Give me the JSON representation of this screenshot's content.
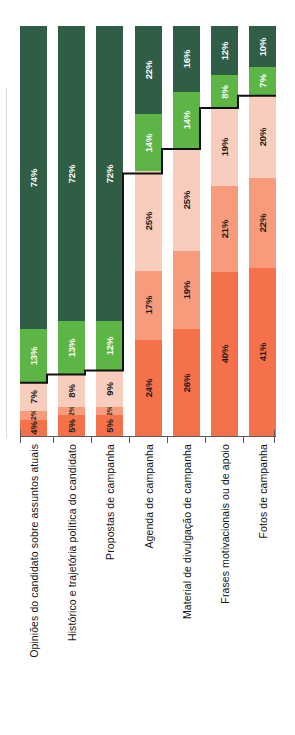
{
  "chart_data": {
    "type": "bar",
    "orientation": "vertical-stacked-100-rotated",
    "title": "",
    "subtitle": "",
    "xlabel": "",
    "ylabel": "",
    "ylim": [
      0,
      100
    ],
    "grid": false,
    "legend_position": "none",
    "stacked": true,
    "normalized_percent": true,
    "categories": [
      "Opiniões do candidato sobre assuntos atuais",
      "Histórico e trajetória política do candidato",
      "Propostas de campanha",
      "Agenda de campanha",
      "Material de divulgação de campanha",
      "Frases motivacionais ou de apoio",
      "Fotos de campanha"
    ],
    "series": [
      {
        "name": "s5",
        "color": "#2f5d46",
        "values": [
          74,
          72,
          72,
          22,
          16,
          12,
          10
        ]
      },
      {
        "name": "s4",
        "color": "#5cb544",
        "values": [
          13,
          13,
          12,
          14,
          14,
          8,
          7
        ]
      },
      {
        "name": "s3",
        "color": "#f9cdbd",
        "values": [
          7,
          8,
          9,
          25,
          25,
          19,
          20
        ]
      },
      {
        "name": "s2",
        "color": "#f69b7c",
        "values": [
          2,
          2,
          2,
          17,
          19,
          21,
          22
        ]
      },
      {
        "name": "s1",
        "color": "#f4714a",
        "values": [
          4,
          5,
          5,
          24,
          26,
          40,
          41
        ]
      }
    ],
    "value_labels": [
      [
        "74%",
        "13%",
        "7%",
        "2%",
        "4%"
      ],
      [
        "72%",
        "13%",
        "8%",
        "2%",
        "5%"
      ],
      [
        "72%",
        "12%",
        "9%",
        "2%",
        "5%"
      ],
      [
        "22%",
        "14%",
        "25%",
        "17%",
        "24%"
      ],
      [
        "16%",
        "14%",
        "25%",
        "19%",
        "26%"
      ],
      [
        "12%",
        "8%",
        "19%",
        "21%",
        "40%"
      ],
      [
        "10%",
        "7%",
        "20%",
        "22%",
        "41%"
      ]
    ],
    "annotation": {
      "name": "step-line",
      "description": "black stepped line tracing the boundary between the green (positive) block and the orange (negative) block of each bar"
    }
  },
  "colors": {
    "dark_green": "#2f5d46",
    "light_green": "#5cb544",
    "pale_salmon": "#f9cdbd",
    "mid_salmon": "#f69b7c",
    "dark_orange": "#f4714a",
    "axis": "#5a5a5a",
    "step_line": "#111111",
    "label_dark": "#151515",
    "label_light": "#ffffff",
    "background": "#ffffff"
  }
}
